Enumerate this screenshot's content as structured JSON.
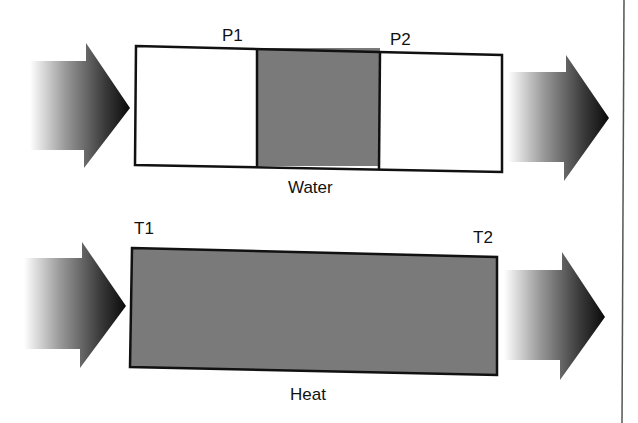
{
  "diagram": {
    "top_row": {
      "label": "Water",
      "left_marker": "P1",
      "right_marker": "P2",
      "sections": [
        "empty",
        "filled",
        "empty"
      ]
    },
    "bottom_row": {
      "label": "Heat",
      "left_marker": "T1",
      "right_marker": "T2",
      "sections": [
        "filled"
      ]
    },
    "colors": {
      "fill": "#7a7a7a",
      "border": "#111111",
      "arrow_dark": "#111111",
      "arrow_light": "#ffffff"
    }
  }
}
